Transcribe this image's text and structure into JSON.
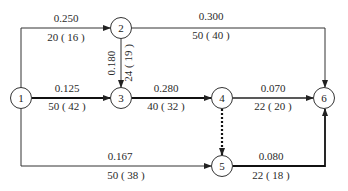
{
  "diagram": {
    "type": "activity-network",
    "nodes": [
      {
        "id": "1",
        "label": "1",
        "x": 21,
        "y": 98
      },
      {
        "id": "2",
        "label": "2",
        "x": 121,
        "y": 28
      },
      {
        "id": "3",
        "label": "3",
        "x": 121,
        "y": 98
      },
      {
        "id": "4",
        "label": "4",
        "x": 222,
        "y": 98
      },
      {
        "id": "5",
        "label": "5",
        "x": 222,
        "y": 166
      },
      {
        "id": "6",
        "label": "6",
        "x": 324,
        "y": 98
      }
    ],
    "edges": [
      {
        "from": "1",
        "to": "2",
        "top_label": "0.250",
        "bottom_label": "20 ( 16 )",
        "style": "solid"
      },
      {
        "from": "2",
        "to": "6",
        "top_label": "0.300",
        "bottom_label": "50 ( 40 )",
        "style": "solid"
      },
      {
        "from": "2",
        "to": "3",
        "top_label": "0.180",
        "bottom_label": "24 ( 19 )",
        "style": "solid"
      },
      {
        "from": "1",
        "to": "3",
        "top_label": "0.125",
        "bottom_label": "50 ( 42 )",
        "style": "bold"
      },
      {
        "from": "3",
        "to": "4",
        "top_label": "0.280",
        "bottom_label": "40 ( 32 )",
        "style": "bold"
      },
      {
        "from": "4",
        "to": "6",
        "top_label": "0.070",
        "bottom_label": "22 ( 20 )",
        "style": "solid"
      },
      {
        "from": "4",
        "to": "5",
        "top_label": "",
        "bottom_label": "",
        "style": "dummy-dotted"
      },
      {
        "from": "1",
        "to": "5",
        "top_label": "0.167",
        "bottom_label": "50 ( 38 )",
        "style": "solid"
      },
      {
        "from": "5",
        "to": "6",
        "top_label": "0.080",
        "bottom_label": "22 ( 18 )",
        "style": "bold"
      }
    ]
  }
}
